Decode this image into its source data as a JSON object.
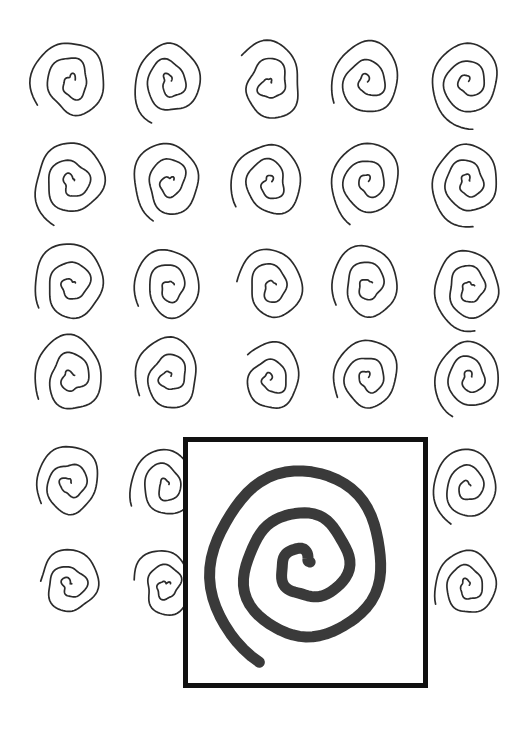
{
  "figure": {
    "canvas": {
      "width": 531,
      "height": 737,
      "background": "#ffffff"
    },
    "ink_color": "#2b2b2b",
    "inset_ink_color": "#3a3a3a",
    "frame_color": "#111111"
  },
  "grid": {
    "name": "spiral-grid",
    "rows": 6,
    "columns": 5,
    "column_centers_x": [
      72,
      170,
      270,
      368,
      468
    ],
    "row_centers_y": [
      82,
      182,
      285,
      377,
      484,
      585
    ],
    "stroke_width": 1.7,
    "turns": 2.6,
    "cells": [
      {
        "row": 1,
        "col": 1,
        "cx": 72,
        "cy": 82,
        "rx": 40,
        "ry": 47,
        "rot": -8,
        "turns": 2.5,
        "wobble": 2.0,
        "seed": 11
      },
      {
        "row": 1,
        "col": 2,
        "cx": 170,
        "cy": 82,
        "rx": 37,
        "ry": 45,
        "rot": -4,
        "turns": 2.6,
        "wobble": 1.8,
        "seed": 12
      },
      {
        "row": 1,
        "col": 3,
        "cx": 270,
        "cy": 84,
        "rx": 37,
        "ry": 44,
        "rot": -10,
        "turns": 2.3,
        "wobble": 2.3,
        "seed": 13
      },
      {
        "row": 1,
        "col": 4,
        "cx": 368,
        "cy": 82,
        "rx": 38,
        "ry": 45,
        "rot": -6,
        "turns": 2.5,
        "wobble": 2.0,
        "seed": 14
      },
      {
        "row": 1,
        "col": 5,
        "cx": 468,
        "cy": 82,
        "rx": 40,
        "ry": 46,
        "rot": -3,
        "turns": 2.7,
        "wobble": 1.6,
        "seed": 15
      },
      {
        "row": 2,
        "col": 1,
        "cx": 72,
        "cy": 182,
        "rx": 40,
        "ry": 46,
        "rot": -7,
        "turns": 2.6,
        "wobble": 1.9,
        "seed": 21
      },
      {
        "row": 2,
        "col": 2,
        "cx": 170,
        "cy": 182,
        "rx": 38,
        "ry": 45,
        "rot": -5,
        "turns": 2.6,
        "wobble": 1.8,
        "seed": 22
      },
      {
        "row": 2,
        "col": 3,
        "cx": 270,
        "cy": 183,
        "rx": 38,
        "ry": 45,
        "rot": -9,
        "turns": 2.5,
        "wobble": 2.1,
        "seed": 23
      },
      {
        "row": 2,
        "col": 4,
        "cx": 368,
        "cy": 182,
        "rx": 39,
        "ry": 46,
        "rot": -6,
        "turns": 2.6,
        "wobble": 1.9,
        "seed": 24
      },
      {
        "row": 2,
        "col": 5,
        "cx": 468,
        "cy": 182,
        "rx": 38,
        "ry": 46,
        "rot": -4,
        "turns": 2.7,
        "wobble": 1.7,
        "seed": 25
      },
      {
        "row": 3,
        "col": 1,
        "cx": 72,
        "cy": 285,
        "rx": 40,
        "ry": 46,
        "rot": -9,
        "turns": 2.5,
        "wobble": 2.1,
        "seed": 31
      },
      {
        "row": 3,
        "col": 2,
        "cx": 170,
        "cy": 287,
        "rx": 36,
        "ry": 43,
        "rot": -5,
        "turns": 2.5,
        "wobble": 1.8,
        "seed": 32
      },
      {
        "row": 3,
        "col": 3,
        "cx": 272,
        "cy": 287,
        "rx": 35,
        "ry": 42,
        "rot": -7,
        "turns": 2.4,
        "wobble": 2.0,
        "seed": 33
      },
      {
        "row": 3,
        "col": 4,
        "cx": 368,
        "cy": 285,
        "rx": 37,
        "ry": 44,
        "rot": -6,
        "turns": 2.5,
        "wobble": 1.9,
        "seed": 34
      },
      {
        "row": 3,
        "col": 5,
        "cx": 470,
        "cy": 288,
        "rx": 38,
        "ry": 45,
        "rot": -4,
        "turns": 2.7,
        "wobble": 1.7,
        "seed": 35
      },
      {
        "row": 4,
        "col": 1,
        "cx": 72,
        "cy": 377,
        "rx": 39,
        "ry": 45,
        "rot": -8,
        "turns": 2.5,
        "wobble": 2.0,
        "seed": 41
      },
      {
        "row": 4,
        "col": 2,
        "cx": 170,
        "cy": 377,
        "rx": 36,
        "ry": 43,
        "rot": -5,
        "turns": 2.5,
        "wobble": 1.8,
        "seed": 42
      },
      {
        "row": 4,
        "col": 3,
        "cx": 271,
        "cy": 380,
        "rx": 33,
        "ry": 39,
        "rot": -8,
        "turns": 2.3,
        "wobble": 2.0,
        "seed": 43
      },
      {
        "row": 4,
        "col": 4,
        "cx": 368,
        "cy": 378,
        "rx": 36,
        "ry": 43,
        "rot": -6,
        "turns": 2.5,
        "wobble": 1.9,
        "seed": 44
      },
      {
        "row": 4,
        "col": 5,
        "cx": 470,
        "cy": 378,
        "rx": 36,
        "ry": 43,
        "rot": -4,
        "turns": 2.6,
        "wobble": 1.7,
        "seed": 45
      },
      {
        "row": 5,
        "col": 1,
        "cx": 70,
        "cy": 484,
        "rx": 36,
        "ry": 42,
        "rot": -8,
        "turns": 2.5,
        "wobble": 2.0,
        "seed": 51
      },
      {
        "row": 5,
        "col": 2,
        "cx": 166,
        "cy": 486,
        "rx": 36,
        "ry": 42,
        "rot": -5,
        "turns": 2.5,
        "wobble": 1.9,
        "seed": 52
      },
      {
        "row": 5,
        "col": 3,
        "cx": 270,
        "cy": 486,
        "rx": 36,
        "ry": 42,
        "rot": -7,
        "turns": 2.5,
        "wobble": 1.9,
        "seed": 53
      },
      {
        "row": 5,
        "col": 4,
        "cx": 368,
        "cy": 486,
        "rx": 36,
        "ry": 42,
        "rot": -6,
        "turns": 2.5,
        "wobble": 1.9,
        "seed": 54
      },
      {
        "row": 5,
        "col": 5,
        "cx": 468,
        "cy": 487,
        "rx": 37,
        "ry": 43,
        "rot": -4,
        "turns": 2.6,
        "wobble": 1.7,
        "seed": 55
      },
      {
        "row": 6,
        "col": 1,
        "cx": 70,
        "cy": 585,
        "rx": 33,
        "ry": 38,
        "rot": -8,
        "turns": 2.4,
        "wobble": 2.0,
        "seed": 61
      },
      {
        "row": 6,
        "col": 2,
        "cx": 166,
        "cy": 586,
        "rx": 33,
        "ry": 38,
        "rot": -5,
        "turns": 2.4,
        "wobble": 1.9,
        "seed": 62
      },
      {
        "row": 6,
        "col": 3,
        "cx": 270,
        "cy": 586,
        "rx": 34,
        "ry": 39,
        "rot": -7,
        "turns": 2.4,
        "wobble": 1.9,
        "seed": 63
      },
      {
        "row": 6,
        "col": 4,
        "cx": 368,
        "cy": 586,
        "rx": 34,
        "ry": 39,
        "rot": -6,
        "turns": 2.4,
        "wobble": 1.9,
        "seed": 64
      },
      {
        "row": 6,
        "col": 5,
        "cx": 468,
        "cy": 586,
        "rx": 34,
        "ry": 40,
        "rot": -4,
        "turns": 2.5,
        "wobble": 1.7,
        "seed": 65
      }
    ]
  },
  "inset": {
    "name": "magnified-spiral-panel",
    "frame": {
      "x": 183,
      "y": 437,
      "width": 245,
      "height": 251,
      "border_width": 5
    },
    "spiral": {
      "cx": 305,
      "cy": 565,
      "rx": 102,
      "ry": 108,
      "rot": -6,
      "turns": 2.6,
      "stroke_width": 11,
      "wobble": 3.0,
      "seed": 99
    }
  },
  "chart_data": {
    "type": "scatter",
    "xlabel": "",
    "ylabel": "",
    "grid": true,
    "legend": "none",
    "categories": [
      "row-1",
      "row-2",
      "row-3",
      "row-4",
      "row-5",
      "row-6"
    ],
    "series": [
      {
        "name": "spirals-per-row",
        "values": [
          5,
          5,
          5,
          5,
          5,
          5
        ]
      }
    ]
  }
}
